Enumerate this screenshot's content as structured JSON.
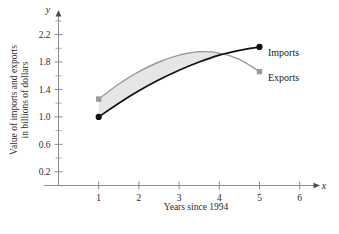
{
  "chart_data": {
    "type": "line",
    "title": "",
    "xlabel": "Years since 1994",
    "ylabel": "Value of imports and exports in billions of dollars",
    "ylabel_line1": "Value of imports and exports",
    "ylabel_line2": "in billions of dollars",
    "xlim": [
      0,
      6.6
    ],
    "ylim": [
      0,
      2.55
    ],
    "grid": false,
    "legend_position": "right-inline",
    "x_ticks": [
      1,
      2,
      3,
      4,
      5,
      6
    ],
    "x_tick_labels": [
      "1",
      "2",
      "3",
      "4",
      "5",
      "6"
    ],
    "y_ticks": [
      0.2,
      0.6,
      1.0,
      1.4,
      1.8,
      2.2
    ],
    "y_tick_labels": [
      "0.2",
      "0.6",
      "1.0",
      "1.4",
      "1.8",
      "2.2"
    ],
    "y_minor_ticks": [
      0.4,
      0.8,
      1.2,
      1.6,
      2.0,
      2.4
    ],
    "x_axis_letter": "x",
    "y_axis_letter": "y",
    "shaded_region": {
      "label": "area between curves",
      "color": "#e6e6e6",
      "x_start": 1,
      "x_end": 4
    },
    "series": [
      {
        "name": "Imports",
        "color": "#111111",
        "marker": "circle",
        "marker_color": "#111111",
        "x": [
          1,
          1.5,
          2,
          2.5,
          3,
          3.5,
          4,
          4.5,
          5
        ],
        "y": [
          1.0,
          1.2,
          1.38,
          1.54,
          1.68,
          1.8,
          1.9,
          1.97,
          2.02
        ]
      },
      {
        "name": "Exports",
        "color": "#9a9a9a",
        "marker": "square",
        "marker_color": "#9a9a9a",
        "x": [
          1,
          1.5,
          2,
          2.5,
          3,
          3.5,
          4,
          4.5,
          5
        ],
        "y": [
          1.26,
          1.48,
          1.66,
          1.8,
          1.9,
          1.95,
          1.93,
          1.84,
          1.66
        ]
      }
    ],
    "annotations": [
      {
        "name": "legend-imports",
        "text": "Imports",
        "x": 5,
        "y": 2.02
      },
      {
        "name": "legend-exports",
        "text": "Exports",
        "x": 5,
        "y": 1.66
      }
    ]
  },
  "figure": {
    "caption": ""
  }
}
